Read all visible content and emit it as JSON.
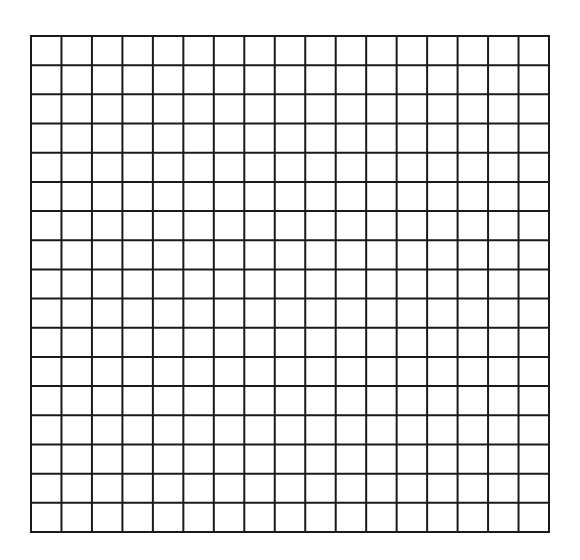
{
  "grid": {
    "rows": 17,
    "columns": 17,
    "line_color": "#1a1a1a",
    "background_color": "#ffffff",
    "line_width": 2
  }
}
